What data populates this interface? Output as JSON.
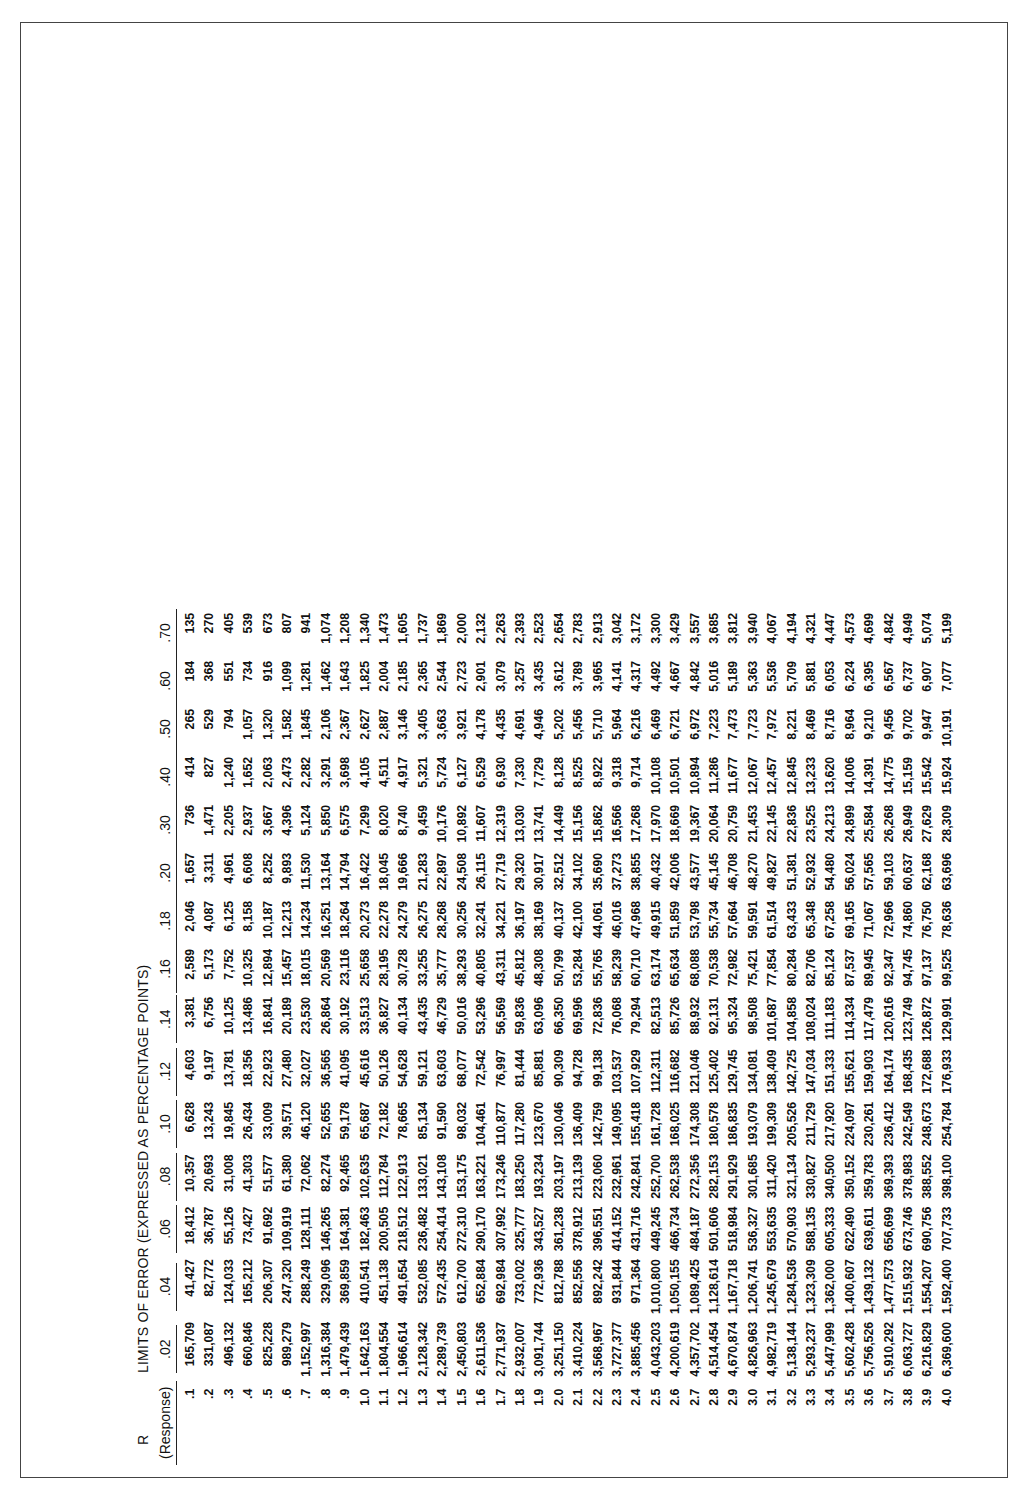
{
  "table": {
    "r_label": "R",
    "title": "LIMITS OF ERROR (EXPRESSED AS PERCENTAGE POINTS)",
    "row_header": "(Response)",
    "columns": [
      ".02",
      ".04",
      ".06",
      ".08",
      ".10",
      ".12",
      ".14",
      ".16",
      ".18",
      ".20",
      ".30",
      ".40",
      ".50",
      ".60",
      ".70"
    ],
    "rows": [
      {
        "r": ".1",
        "v": [
          "165,709",
          "41,427",
          "18,412",
          "10,357",
          "6,628",
          "4,603",
          "3,381",
          "2,589",
          "2,046",
          "1,657",
          "736",
          "414",
          "265",
          "184",
          "135"
        ]
      },
      {
        "r": ".2",
        "v": [
          "331,087",
          "82,772",
          "36,787",
          "20,693",
          "13,243",
          "9,197",
          "6,756",
          "5,173",
          "4,087",
          "3,311",
          "1,471",
          "827",
          "529",
          "368",
          "270"
        ]
      },
      {
        "r": ".3",
        "v": [
          "496,132",
          "124,033",
          "55,126",
          "31,008",
          "19,845",
          "13,781",
          "10,125",
          "7,752",
          "6,125",
          "4,961",
          "2,205",
          "1,240",
          "794",
          "551",
          "405"
        ]
      },
      {
        "r": ".4",
        "v": [
          "660,846",
          "165,212",
          "73,427",
          "41,303",
          "26,434",
          "18,356",
          "13,486",
          "10,325",
          "8,158",
          "6,608",
          "2,937",
          "1,652",
          "1,057",
          "734",
          "539"
        ]
      },
      {
        "r": ".5",
        "v": [
          "825,228",
          "206,307",
          "91,692",
          "51,577",
          "33,009",
          "22,923",
          "16,841",
          "12,894",
          "10,187",
          "8,252",
          "3,667",
          "2,063",
          "1,320",
          "916",
          "673"
        ]
      },
      {
        "r": ".6",
        "v": [
          "989,279",
          "247,320",
          "109,919",
          "61,380",
          "39,571",
          "27,480",
          "20,189",
          "15,457",
          "12,213",
          "9,893",
          "4,396",
          "2,473",
          "1,582",
          "1,099",
          "807"
        ]
      },
      {
        "r": ".7",
        "v": [
          "1,152,997",
          "288,249",
          "128,111",
          "72,062",
          "46,120",
          "32,027",
          "23,530",
          "18,015",
          "14,234",
          "11,530",
          "5,124",
          "2,282",
          "1,845",
          "1,281",
          "941"
        ]
      },
      {
        "r": ".8",
        "v": [
          "1,316,384",
          "329,096",
          "146,265",
          "82,274",
          "52,655",
          "36,565",
          "26,864",
          "20,569",
          "16,251",
          "13,164",
          "5,850",
          "3,291",
          "2,106",
          "1,462",
          "1,074"
        ]
      },
      {
        "r": ".9",
        "v": [
          "1,479,439",
          "369,859",
          "164,381",
          "92,465",
          "59,178",
          "41,095",
          "30,192",
          "23,116",
          "18,264",
          "14,794",
          "6,575",
          "3,698",
          "2,367",
          "1,643",
          "1,208"
        ]
      },
      {
        "r": "1.0",
        "v": [
          "1,642,163",
          "410,541",
          "182,463",
          "102,635",
          "65,687",
          "45,616",
          "33,513",
          "25,658",
          "20,273",
          "16,422",
          "7,299",
          "4,105",
          "2,627",
          "1,825",
          "1,340"
        ]
      },
      {
        "r": "1.1",
        "v": [
          "1,804,554",
          "451,138",
          "200,505",
          "112,784",
          "72,182",
          "50,126",
          "36,827",
          "28,195",
          "22,278",
          "18,045",
          "8,020",
          "4,511",
          "2,887",
          "2,004",
          "1,473"
        ]
      },
      {
        "r": "1.2",
        "v": [
          "1,966,614",
          "491,654",
          "218,512",
          "122,913",
          "78,665",
          "54,628",
          "40,134",
          "30,728",
          "24,279",
          "19,666",
          "8,740",
          "4,917",
          "3,146",
          "2,185",
          "1,605"
        ]
      },
      {
        "r": "1.3",
        "v": [
          "2,128,342",
          "532,085",
          "236,482",
          "133,021",
          "85,134",
          "59,121",
          "43,435",
          "33,255",
          "26,275",
          "21,283",
          "9,459",
          "5,321",
          "3,405",
          "2,365",
          "1,737"
        ]
      },
      {
        "r": "1.4",
        "v": [
          "2,289,739",
          "572,435",
          "254,414",
          "143,108",
          "91,590",
          "63,603",
          "46,729",
          "35,777",
          "28,268",
          "22,897",
          "10,176",
          "5,724",
          "3,663",
          "2,544",
          "1,869"
        ]
      },
      {
        "r": "1.5",
        "v": [
          "2,450,803",
          "612,700",
          "272,310",
          "153,175",
          "98,032",
          "68,077",
          "50,016",
          "38,293",
          "30,256",
          "24,508",
          "10,892",
          "6,127",
          "3,921",
          "2,723",
          "2,000"
        ]
      },
      {
        "r": "1.6",
        "v": [
          "2,611,536",
          "652,884",
          "290,170",
          "163,221",
          "104,461",
          "72,542",
          "53,296",
          "40,805",
          "32,241",
          "26,115",
          "11,607",
          "6,529",
          "4,178",
          "2,901",
          "2,132"
        ]
      },
      {
        "r": "1.7",
        "v": [
          "2,771,937",
          "692,984",
          "307,992",
          "173,246",
          "110,877",
          "76,997",
          "56,569",
          "43,311",
          "34,221",
          "27,719",
          "12,319",
          "6,930",
          "4,435",
          "3,079",
          "2,263"
        ]
      },
      {
        "r": "1.8",
        "v": [
          "2,932,007",
          "733,002",
          "325,777",
          "183,250",
          "117,280",
          "81,444",
          "59,836",
          "45,812",
          "36,197",
          "29,320",
          "13,030",
          "7,330",
          "4,691",
          "3,257",
          "2,393"
        ]
      },
      {
        "r": "1.9",
        "v": [
          "3,091,744",
          "772,936",
          "343,527",
          "193,234",
          "123,670",
          "85,881",
          "63,096",
          "48,308",
          "38,169",
          "30,917",
          "13,741",
          "7,729",
          "4,946",
          "3,435",
          "2,523"
        ]
      },
      {
        "r": "2.0",
        "v": [
          "3,251,150",
          "812,788",
          "361,238",
          "203,197",
          "130,046",
          "90,309",
          "66,350",
          "50,799",
          "40,137",
          "32,512",
          "14,449",
          "8,128",
          "5,202",
          "3,612",
          "2,654"
        ]
      },
      {
        "r": "2.1",
        "v": [
          "3,410,224",
          "852,556",
          "378,912",
          "213,139",
          "136,409",
          "94,728",
          "69,596",
          "53,284",
          "42,100",
          "34,102",
          "15,156",
          "8,525",
          "5,456",
          "3,789",
          "2,783"
        ]
      },
      {
        "r": "2.2",
        "v": [
          "3,568,967",
          "892,242",
          "396,551",
          "223,060",
          "142,759",
          "99,138",
          "72,836",
          "55,765",
          "44,061",
          "35,690",
          "15,862",
          "8,922",
          "5,710",
          "3,965",
          "2,913"
        ]
      },
      {
        "r": "2.3",
        "v": [
          "3,727,377",
          "931,844",
          "414,152",
          "232,961",
          "149,095",
          "103,537",
          "76,068",
          "58,239",
          "46,016",
          "37,273",
          "16,566",
          "9,318",
          "5,964",
          "4,141",
          "3,042"
        ]
      },
      {
        "r": "2.4",
        "v": [
          "3,885,456",
          "971,364",
          "431,716",
          "242,841",
          "155,418",
          "107,929",
          "79,294",
          "60,710",
          "47,968",
          "38,855",
          "17,268",
          "9,714",
          "6,216",
          "4,317",
          "3,172"
        ]
      },
      {
        "r": "2.5",
        "v": [
          "4,043,203",
          "1,010,800",
          "449,245",
          "252,700",
          "161,728",
          "112,311",
          "82,513",
          "63,174",
          "49,915",
          "40,432",
          "17,970",
          "10,108",
          "6,469",
          "4,492",
          "3,300"
        ]
      },
      {
        "r": "2.6",
        "v": [
          "4,200,619",
          "1,050,155",
          "466,734",
          "262,538",
          "168,025",
          "116,682",
          "85,726",
          "65,634",
          "51,859",
          "42,006",
          "18,669",
          "10,501",
          "6,721",
          "4,667",
          "3,429"
        ]
      },
      {
        "r": "2.7",
        "v": [
          "4,357,702",
          "1,089,425",
          "484,187",
          "272,356",
          "174,308",
          "121,046",
          "88,932",
          "68,088",
          "53,798",
          "43,577",
          "19,367",
          "10,894",
          "6,972",
          "4,842",
          "3,557"
        ]
      },
      {
        "r": "2.8",
        "v": [
          "4,514,454",
          "1,128,614",
          "501,606",
          "282,153",
          "180,578",
          "125,402",
          "92,131",
          "70,538",
          "55,734",
          "45,145",
          "20,064",
          "11,286",
          "7,223",
          "5,016",
          "3,685"
        ]
      },
      {
        "r": "2.9",
        "v": [
          "4,670,874",
          "1,167,718",
          "518,984",
          "291,929",
          "186,835",
          "129,745",
          "95,324",
          "72,982",
          "57,664",
          "46,708",
          "20,759",
          "11,677",
          "7,473",
          "5,189",
          "3,812"
        ]
      },
      {
        "r": "3.0",
        "v": [
          "4,826,963",
          "1,206,741",
          "536,327",
          "301,685",
          "193,079",
          "134,081",
          "98,508",
          "75,421",
          "59,591",
          "48,270",
          "21,453",
          "12,067",
          "7,723",
          "5,363",
          "3,940"
        ]
      },
      {
        "r": "3.1",
        "v": [
          "4,982,719",
          "1,245,679",
          "553,635",
          "311,420",
          "199,309",
          "138,409",
          "101,687",
          "77,854",
          "61,514",
          "49,827",
          "22,145",
          "12,457",
          "7,972",
          "5,536",
          "4,067"
        ]
      },
      {
        "r": "3.2",
        "v": [
          "5,138,144",
          "1,284,536",
          "570,903",
          "321,134",
          "205,526",
          "142,725",
          "104,858",
          "80,284",
          "63,433",
          "51,381",
          "22,836",
          "12,845",
          "8,221",
          "5,709",
          "4,194"
        ]
      },
      {
        "r": "3.3",
        "v": [
          "5,293,237",
          "1,323,309",
          "588,135",
          "330,827",
          "211,729",
          "147,034",
          "108,024",
          "82,706",
          "65,348",
          "52,932",
          "23,525",
          "13,233",
          "8,469",
          "5,881",
          "4,321"
        ]
      },
      {
        "r": "3.4",
        "v": [
          "5,447,999",
          "1,362,000",
          "605,333",
          "340,500",
          "217,920",
          "151,333",
          "111,183",
          "85,124",
          "67,258",
          "54,480",
          "24,213",
          "13,620",
          "8,716",
          "6,053",
          "4,447"
        ]
      },
      {
        "r": "3.5",
        "v": [
          "5,602,428",
          "1,400,607",
          "622,490",
          "350,152",
          "224,097",
          "155,621",
          "114,334",
          "87,537",
          "69,165",
          "56,024",
          "24,899",
          "14,006",
          "8,964",
          "6,224",
          "4,573"
        ]
      },
      {
        "r": "3.6",
        "v": [
          "5,756,526",
          "1,439,132",
          "639,611",
          "359,783",
          "230,261",
          "159,903",
          "117,479",
          "89,945",
          "71,067",
          "57,565",
          "25,584",
          "14,391",
          "9,210",
          "6,395",
          "4,699"
        ]
      },
      {
        "r": "3.7",
        "v": [
          "5,910,292",
          "1,477,573",
          "656,699",
          "369,393",
          "236,412",
          "164,174",
          "120,616",
          "92,347",
          "72,966",
          "59,103",
          "26,268",
          "14,775",
          "9,456",
          "6,567",
          "4,842"
        ]
      },
      {
        "r": "3.8",
        "v": [
          "6,063,727",
          "1,515,932",
          "673,746",
          "378,983",
          "242,549",
          "168,435",
          "123,749",
          "94,745",
          "74,860",
          "60,637",
          "26,949",
          "15,159",
          "9,702",
          "6,737",
          "4,949"
        ]
      },
      {
        "r": "3.9",
        "v": [
          "6,216,829",
          "1,554,207",
          "690,756",
          "388,552",
          "248,673",
          "172,688",
          "126,872",
          "97,137",
          "76,750",
          "62,168",
          "27,629",
          "15,542",
          "9,947",
          "6,907",
          "5,074"
        ]
      },
      {
        "r": "4.0",
        "v": [
          "6,369,600",
          "1,592,400",
          "707,733",
          "398,100",
          "254,784",
          "176,933",
          "129,991",
          "99,525",
          "78,636",
          "63,696",
          "28,309",
          "15,924",
          "10,191",
          "7,077",
          "5,199"
        ]
      }
    ]
  }
}
